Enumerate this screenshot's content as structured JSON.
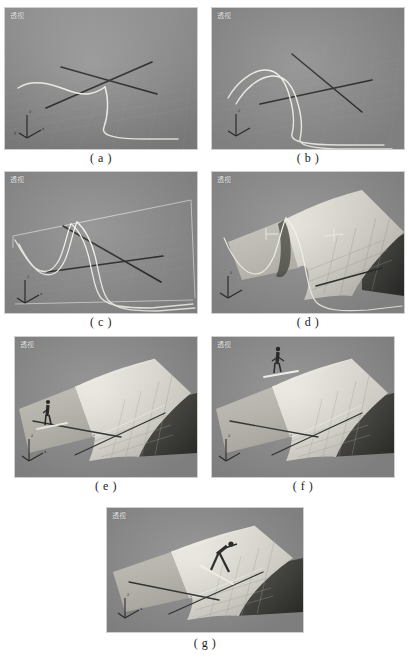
{
  "figure": {
    "kind": "3d-modeling-tutorial-steps",
    "panel_count": 7,
    "viewport_label": "透视",
    "background_color": "#ffffff",
    "viewport_color": "#8e8e8e",
    "curve_color": "#f5f5f0",
    "axis_color": "#2b2b2b",
    "surface_light": "#e8e6de",
    "surface_dark": "#3a3a38"
  },
  "panels": [
    {
      "id": "a",
      "caption": "( a )",
      "label": "透视",
      "step": "两条交叉的轮廓曲线",
      "has_surface": false,
      "has_figure": false,
      "curves": 2,
      "x": 5,
      "y": 8,
      "w": 192,
      "h": 141
    },
    {
      "id": "b",
      "caption": "( b )",
      "label": "透视",
      "step": "增加放样截面曲线",
      "has_surface": false,
      "has_figure": false,
      "curves": 3,
      "x": 212,
      "y": 8,
      "w": 192,
      "h": 141
    },
    {
      "id": "c",
      "caption": "( c )",
      "label": "透视",
      "step": "完成全部截面曲线",
      "has_surface": false,
      "has_figure": false,
      "curves": 4,
      "x": 5,
      "y": 172,
      "w": 192,
      "h": 141
    },
    {
      "id": "d",
      "caption": "( d )",
      "label": "透视",
      "step": "放样生成曲面",
      "has_surface": true,
      "has_figure": false,
      "curves": 4,
      "x": 212,
      "y": 172,
      "w": 192,
      "h": 141
    },
    {
      "id": "e",
      "caption": "( e )",
      "label": "透视",
      "step": "加入人物模型于起跳台",
      "has_surface": true,
      "has_figure": true,
      "figure_pose": "standing",
      "curves": 0,
      "x": 15,
      "y": 337,
      "w": 182,
      "h": 140
    },
    {
      "id": "f",
      "caption": "( f )",
      "label": "透视",
      "step": "人物移动到坡顶",
      "has_surface": true,
      "has_figure": true,
      "figure_pose": "standing",
      "curves": 0,
      "x": 212,
      "y": 337,
      "w": 182,
      "h": 140
    },
    {
      "id": "g",
      "caption": "( g )",
      "label": "透视",
      "step": "人物沿坡面下滑",
      "has_surface": true,
      "has_figure": true,
      "figure_pose": "crouched-sliding",
      "curves": 0,
      "x": 107,
      "y": 508,
      "w": 196,
      "h": 124
    }
  ],
  "captions": [
    {
      "text": "( a )",
      "x": 5,
      "y": 151,
      "w": 192
    },
    {
      "text": "( b )",
      "x": 212,
      "y": 151,
      "w": 192
    },
    {
      "text": "( c )",
      "x": 5,
      "y": 315,
      "w": 192
    },
    {
      "text": "( d )",
      "x": 212,
      "y": 315,
      "w": 192
    },
    {
      "text": "( e )",
      "x": 15,
      "y": 479,
      "w": 182
    },
    {
      "text": "( f )",
      "x": 212,
      "y": 479,
      "w": 182
    },
    {
      "text": "( g )",
      "x": 107,
      "y": 636,
      "w": 196
    }
  ]
}
